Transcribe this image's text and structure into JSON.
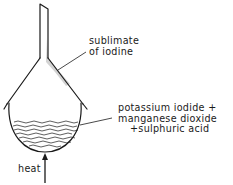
{
  "diagram": {
    "labels": {
      "sublimate_line1": "sublimate",
      "sublimate_line2": "of iodine",
      "mixture_line1": "potassium iodide +",
      "mixture_line2": "manganese dioxide",
      "mixture_line3": "+sulphuric acid",
      "heat": "heat"
    },
    "colors": {
      "ink": "#1a1a1a",
      "sublimate_shading": "#b8b8b8",
      "background": "#ffffff"
    }
  }
}
